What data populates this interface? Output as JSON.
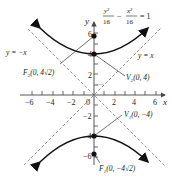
{
  "diagram": {
    "equation": {
      "num1": "y²",
      "den1": "16",
      "minus": "−",
      "num2": "x²",
      "den2": "16",
      "eq": "= 1"
    },
    "axes": {
      "x_label": "x",
      "y_label": "y",
      "x_ticks": [
        "−6",
        "−4",
        "−2",
        "0",
        "2",
        "4",
        "6"
      ],
      "y_ticks": [
        "6",
        "4",
        "2",
        "−2",
        "−4",
        "−6"
      ]
    },
    "asymptotes": {
      "neg": "y = −x",
      "pos": "y = x"
    },
    "points": {
      "F2": "F₂(0, 4√2)",
      "V2": "V₂(0, 4)",
      "V1": "V₁(0, −4)",
      "F1": "F₁(0, −4√2)"
    },
    "colors": {
      "curve": "#111111",
      "axis": "#444444",
      "asymptote": "#777777",
      "accent": "#8fd48f"
    }
  }
}
